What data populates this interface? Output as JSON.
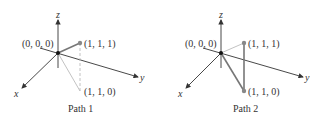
{
  "figure": {
    "panels": [
      {
        "caption": "Path 1",
        "offset_x": 0,
        "labels": {
          "origin": "(0, 0, 0)",
          "p111": "(1, 1, 1)",
          "p110": "(1, 1, 0)",
          "x_axis": "x",
          "y_axis": "y",
          "z_axis": "z"
        },
        "path_description": "Direct segment from (0,0,0) to (1,1,1)"
      },
      {
        "caption": "Path 2",
        "offset_x": 163,
        "labels": {
          "origin": "(0, 0, 0)",
          "p111": "(1, 1, 1)",
          "p110": "(1, 1, 0)",
          "x_axis": "x",
          "y_axis": "y",
          "z_axis": "z"
        },
        "path_description": "Segment from (0,0,0) to (1,1,0), then (1,1,0) to (1,1,1)"
      }
    ],
    "colors": {
      "axis": "#333333",
      "path": "#777777",
      "guide": "#bbbbbb",
      "point": "#888888",
      "origin_point": "#111111"
    }
  }
}
